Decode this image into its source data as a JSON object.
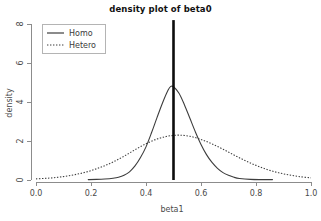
{
  "chart_data": {
    "type": "line",
    "title": "density plot of beta0",
    "xlabel": "beta1",
    "ylabel": "density",
    "xlim": [
      0.0,
      1.0
    ],
    "ylim": [
      0,
      8
    ],
    "grid": false,
    "legend_position": "top-left",
    "xticks": [
      "0.0",
      "0.2",
      "0.4",
      "0.6",
      "0.8",
      "1.0"
    ],
    "xtick_values": [
      0.0,
      0.2,
      0.4,
      0.6,
      0.8,
      1.0
    ],
    "yticks": [
      "0",
      "2",
      "4",
      "6",
      "8"
    ],
    "ytick_values": [
      0,
      2,
      4,
      6,
      8
    ],
    "series": [
      {
        "name": "Homo",
        "style": "solid",
        "peak_x": 0.49,
        "peak_y": 4.8,
        "x": [
          0.19,
          0.22,
          0.25,
          0.28,
          0.3,
          0.32,
          0.34,
          0.36,
          0.38,
          0.4,
          0.42,
          0.44,
          0.46,
          0.48,
          0.49,
          0.5,
          0.52,
          0.54,
          0.56,
          0.58,
          0.6,
          0.62,
          0.64,
          0.66,
          0.68,
          0.7,
          0.72,
          0.74,
          0.78,
          0.82,
          0.86
        ],
        "values": [
          0.02,
          0.03,
          0.05,
          0.09,
          0.14,
          0.24,
          0.42,
          0.72,
          1.15,
          1.7,
          2.42,
          3.2,
          3.95,
          4.6,
          4.8,
          4.78,
          4.45,
          3.85,
          3.15,
          2.45,
          1.82,
          1.3,
          0.9,
          0.6,
          0.38,
          0.24,
          0.14,
          0.08,
          0.03,
          0.02,
          0.02
        ]
      },
      {
        "name": "Hetero",
        "style": "dotted",
        "peak_x": 0.52,
        "peak_y": 2.3,
        "x": [
          0.0,
          0.04,
          0.08,
          0.12,
          0.16,
          0.2,
          0.24,
          0.28,
          0.32,
          0.36,
          0.4,
          0.44,
          0.48,
          0.52,
          0.56,
          0.6,
          0.64,
          0.68,
          0.72,
          0.76,
          0.8,
          0.84,
          0.88,
          0.92,
          0.96,
          1.0
        ],
        "values": [
          0.06,
          0.09,
          0.14,
          0.22,
          0.33,
          0.48,
          0.68,
          0.92,
          1.22,
          1.55,
          1.86,
          2.1,
          2.25,
          2.3,
          2.24,
          2.08,
          1.85,
          1.58,
          1.28,
          1.0,
          0.75,
          0.54,
          0.38,
          0.26,
          0.17,
          0.11
        ]
      }
    ],
    "annotations": [
      {
        "name": "reference-line",
        "type": "vertical-line",
        "x": 0.5,
        "y_top": 8.2,
        "y_bottom": 0
      }
    ]
  },
  "legend": {
    "entries": [
      {
        "label": "Homo",
        "style": "solid"
      },
      {
        "label": "Hetero",
        "style": "dotted"
      }
    ]
  }
}
